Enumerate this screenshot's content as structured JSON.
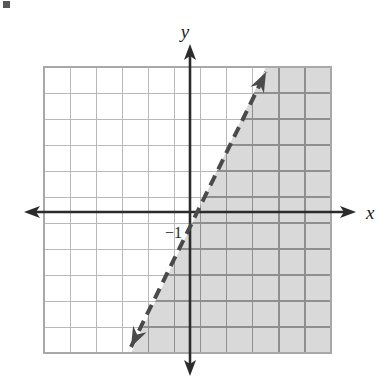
{
  "figure": {
    "name": "linear-inequality-graph",
    "background_color": "#ffffff"
  },
  "axes": {
    "x_label": "x",
    "y_label": "y",
    "axis_color": "#2b2b2b",
    "origin_px": {
      "x": 190,
      "y": 212
    },
    "unit_px": 26,
    "x_axis": {
      "start_px": 24,
      "end_px": 356,
      "y_px": 212,
      "arrows": "both"
    },
    "y_axis": {
      "start_px": 44,
      "end_px": 376,
      "x_px": 190,
      "arrows": "both"
    }
  },
  "grid": {
    "left_px": 44,
    "top_px": 67,
    "right_px": 331,
    "bottom_px": 353,
    "columns": 11,
    "rows": 11,
    "cell_px": 26,
    "line_color_unshaded": "#b8b8b8",
    "line_color_shaded": "#8f8f8f",
    "border_color": "#a8a8a8"
  },
  "labels": {
    "y_intercept": "−1",
    "y_intercept_value": -1,
    "y_intercept_px": {
      "x": 172,
      "y": 232
    },
    "x_axis_label_px": {
      "x": 366,
      "y": 214
    },
    "y_axis_label_px": {
      "x": 185,
      "y": 34
    }
  },
  "boundary_line": {
    "style": "dashed",
    "color": "#4a4a4a",
    "width_px": 4,
    "dash_px": 11,
    "gap_px": 7,
    "arrows": "both",
    "slope": 2,
    "y_intercept": -1,
    "equation": "y = 2x − 1",
    "start_px": {
      "x": 131,
      "y": 347
    },
    "end_px": {
      "x": 266,
      "y": 72
    }
  },
  "shaded_region": {
    "fill_color": "#d9d9d9",
    "side": "right-of-line",
    "inequality": "y > 2x − 1",
    "polygon_px": "331,67 266,67 131,353 331,353"
  },
  "artifact": {
    "corner_mark_px": {
      "x": 3,
      "y": 1,
      "w": 7,
      "h": 7
    },
    "color": "#3a3a3a"
  }
}
